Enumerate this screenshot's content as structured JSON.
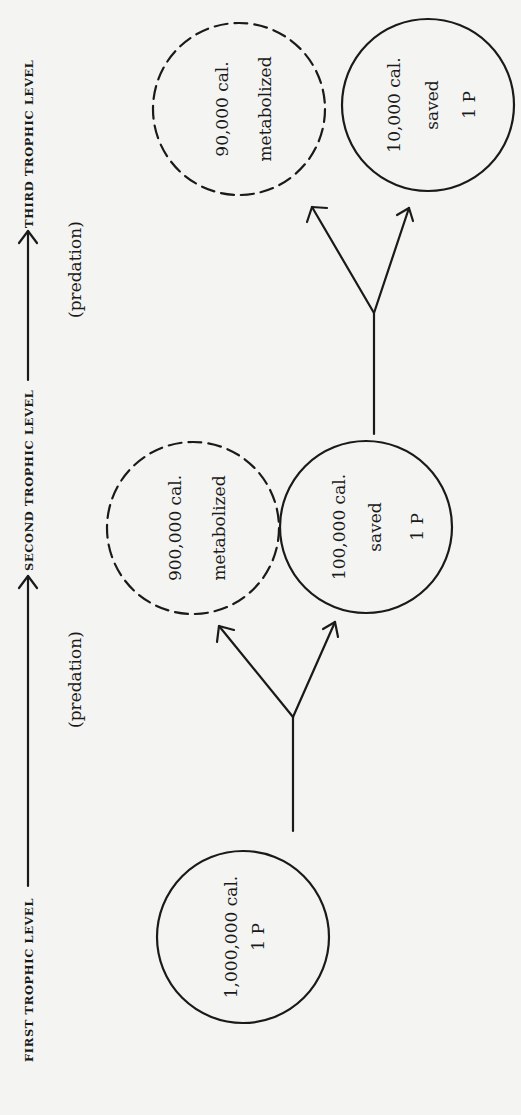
{
  "diagram": {
    "orientation": "rotated-90-ccw",
    "ink_color": "#1a1a1a",
    "background_color": "#f4f4f2",
    "axis": {
      "levels": [
        {
          "label": "FIRST TROPHIC LEVEL"
        },
        {
          "label": "SECOND TROPHIC LEVEL"
        },
        {
          "label": "THIRD TROPHIC LEVEL"
        }
      ],
      "transitions": [
        {
          "label": "(predation)",
          "from": "FIRST TROPHIC LEVEL",
          "to": "SECOND TROPHIC LEVEL"
        },
        {
          "label": "(predation)",
          "from": "SECOND TROPHIC LEVEL",
          "to": "THIRD TROPHIC LEVEL"
        }
      ]
    },
    "nodes": [
      {
        "id": "level1",
        "style": "solid",
        "lines": [
          "1,000,000 cal.",
          "1 P"
        ]
      },
      {
        "id": "level2-metabolized",
        "style": "dashed",
        "lines": [
          "900,000 cal.",
          "metabolized"
        ]
      },
      {
        "id": "level2-saved",
        "style": "solid",
        "lines": [
          "100,000 cal.",
          "saved",
          "1 P"
        ]
      },
      {
        "id": "level3-metabolized",
        "style": "dashed",
        "lines": [
          "90,000 cal.",
          "metabolized"
        ]
      },
      {
        "id": "level3-saved",
        "style": "solid",
        "lines": [
          "10,000 cal.",
          "saved",
          "1 P"
        ]
      }
    ],
    "edges": [
      {
        "from": "level1",
        "to": "level2-metabolized"
      },
      {
        "from": "level1",
        "to": "level2-saved"
      },
      {
        "from": "level2-saved",
        "to": "level3-metabolized"
      },
      {
        "from": "level2-saved",
        "to": "level3-saved"
      }
    ]
  }
}
